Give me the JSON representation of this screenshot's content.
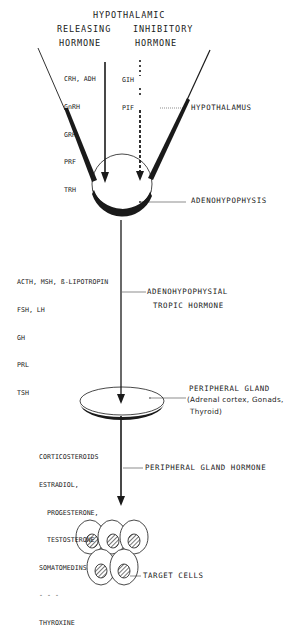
{
  "header": {
    "title": "HYPOTHALAMIC",
    "releasing_line1": "RELEASING",
    "releasing_line2": "HORMONE",
    "inhibitory_line1": "INHIBITORY",
    "inhibitory_line2": "HORMONE"
  },
  "releasing_hormones": [
    "CRH, ADH",
    "GnRH",
    "GRH",
    "PRF",
    "TRH"
  ],
  "inhibitory_hormones": [
    "GIH",
    "PIF"
  ],
  "labels": {
    "hypothalamus": "HYPOTHALAMUS",
    "adenohypophysis": "ADENOHYPOPHYSIS",
    "tropic_line1": "ADENOHYPOPHYSIAL",
    "tropic_line2": "TROPIC HORMONE",
    "peripheral_gland": "PERIPHERAL GLAND",
    "peripheral_gland_detail1": "(Adrenal cortex, Gonads,",
    "peripheral_gland_detail2": "Thyroid)",
    "peripheral_gland_hormone": "PERIPHERAL GLAND HORMONE",
    "target_cells": "TARGET CELLS"
  },
  "tropic_hormones": [
    "ACTH, MSH, ß-LIPOTROPIN",
    "FSH, LH",
    "GH",
    "PRL",
    "TSH"
  ],
  "peripheral_hormones": [
    "CORTICOSTEROIDS",
    "ESTRADIOL,",
    "  PROGESTERONE,",
    "  TESTOSTERONE",
    "SOMATOMEDINS",
    "- - -",
    "THYROXINE"
  ],
  "colors": {
    "ink": "#1a1a1a",
    "background": "#ffffff"
  }
}
